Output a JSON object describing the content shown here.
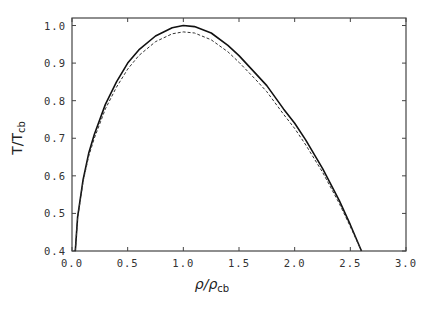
{
  "chart_data": {
    "type": "line",
    "title": "",
    "xlabel": "ρ/ρ_cb",
    "ylabel": "T/T_cb",
    "xlabel_parts": {
      "main": "ρ/ρ",
      "sub": "cb"
    },
    "ylabel_parts": {
      "main": "T/T",
      "sub": "cb"
    },
    "xlim": [
      0.0,
      3.0
    ],
    "ylim": [
      0.4,
      1.02
    ],
    "xticks": [
      "0.0",
      "0.5",
      "1.0",
      "1.5",
      "2.0",
      "2.5",
      "3.0"
    ],
    "yticks": [
      "0.4",
      "0.5",
      "0.6",
      "0.7",
      "0.8",
      "0.9",
      "1.0"
    ],
    "grid": false,
    "legend": null,
    "series": [
      {
        "name": "solid",
        "style": "solid",
        "x": [
          0.03,
          0.05,
          0.1,
          0.15,
          0.2,
          0.3,
          0.4,
          0.5,
          0.6,
          0.75,
          0.9,
          1.0,
          1.1,
          1.25,
          1.4,
          1.5,
          1.65,
          1.75,
          1.9,
          2.0,
          2.1,
          2.25,
          2.4,
          2.5,
          2.6
        ],
        "y": [
          0.4,
          0.49,
          0.59,
          0.66,
          0.71,
          0.79,
          0.85,
          0.9,
          0.935,
          0.972,
          0.994,
          1.0,
          0.997,
          0.98,
          0.947,
          0.92,
          0.872,
          0.84,
          0.778,
          0.74,
          0.695,
          0.62,
          0.535,
          0.47,
          0.4
        ]
      },
      {
        "name": "dashed",
        "style": "dashed",
        "x": [
          0.03,
          0.05,
          0.1,
          0.15,
          0.2,
          0.3,
          0.4,
          0.5,
          0.6,
          0.75,
          0.9,
          1.0,
          1.1,
          1.25,
          1.4,
          1.5,
          1.65,
          1.75,
          1.9,
          2.0,
          2.1,
          2.25,
          2.4,
          2.5,
          2.6
        ],
        "y": [
          0.4,
          0.488,
          0.585,
          0.652,
          0.7,
          0.778,
          0.836,
          0.884,
          0.92,
          0.957,
          0.978,
          0.983,
          0.98,
          0.962,
          0.93,
          0.902,
          0.856,
          0.824,
          0.764,
          0.726,
          0.682,
          0.61,
          0.527,
          0.465,
          0.4
        ]
      }
    ]
  }
}
